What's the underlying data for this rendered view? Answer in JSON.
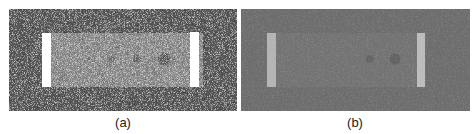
{
  "figure": {
    "panels": [
      {
        "id": "a",
        "caption": "(a)",
        "description": "Noisy grayscale phantom: dark noisy background, lighter rectangular inset with two bright vertical bars at the ends and four faint dark circular lesions of increasing size left to right",
        "background_color": "#5a5a5a",
        "inset_color": "#8f8f8f",
        "bar_color": "#ffffff",
        "noise": "high"
      },
      {
        "id": "b",
        "caption": "(b)",
        "description": "Denoised/smoothed version of the same phantom: uniform mid-gray background, subtle inset, light-gray vertical bars at ends, two faint dark lesions visible",
        "background_color": "#6e6e6e",
        "inset_color": "#747474",
        "bar_color": "#b5b5b5",
        "noise": "low"
      }
    ]
  }
}
